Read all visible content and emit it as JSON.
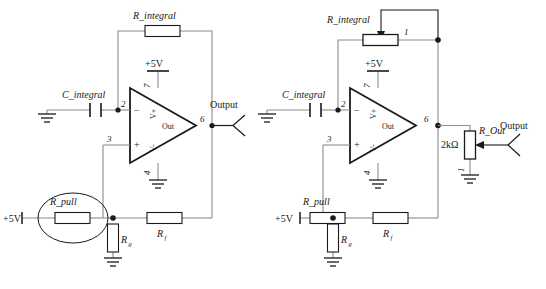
{
  "diagram": {
    "circuits": [
      {
        "id": "left",
        "name": "fixed-resistor-version",
        "components": {
          "r_integral": "R_integral",
          "c_integral": "C_integral",
          "r_pull": "R_pull",
          "r_f": "R",
          "r_f_sub": "f",
          "r_g": "R",
          "r_g_sub": "g",
          "supply_opamp": "+5V",
          "supply_pull": "+5V",
          "output": "Output"
        },
        "opamp": {
          "pin_inverting": "2",
          "pin_noninverting": "3",
          "pin_vplus": "7",
          "pin_vminus": "4",
          "pin_out": "6",
          "label_out": "Out",
          "label_vplus": "V+",
          "label_vminus": "V-",
          "sym_minus": "−",
          "sym_plus": "+"
        },
        "highlight": {
          "shape": "ellipse",
          "target": "R_pull"
        }
      },
      {
        "id": "right",
        "name": "potentiometer-version",
        "components": {
          "r_integral": "R_integral",
          "r_integral_pin": "1",
          "c_integral": "C_integral",
          "r_pull": "R_pull",
          "r_f": "R",
          "r_f_sub": "f",
          "r_g": "R",
          "r_g_sub": "g",
          "r_out": "R_Out",
          "r_out_value": "2kΩ",
          "r_out_pin": "1",
          "supply_opamp": "+5V",
          "supply_pull": "+5V",
          "output": "Output"
        },
        "opamp": {
          "pin_inverting": "2",
          "pin_noninverting": "3",
          "pin_vplus": "7",
          "pin_vminus": "4",
          "pin_out": "6",
          "label_out": "Out",
          "label_vplus": "V+",
          "label_vminus": "V-",
          "sym_minus": "−",
          "sym_plus": "+"
        }
      }
    ],
    "colors": {
      "wire": "#8c8c8c",
      "symbol": "#1a1a1a",
      "text": "#1a1a1a",
      "background": "#ffffff"
    }
  }
}
